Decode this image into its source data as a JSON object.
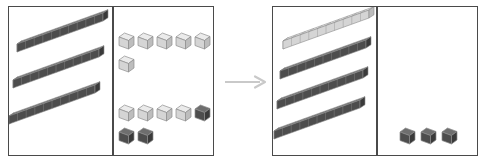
{
  "diagram": {
    "title": "Base-ten regrouping: ten ones exchanged for one ten",
    "type": "base-ten-blocks-regrouping",
    "arrow": {
      "label": "becomes",
      "direction": "right",
      "color": "#c9c9c9"
    },
    "colors": {
      "dark_block": "#4d4d4d",
      "dark_block_top": "#6e6e6e",
      "dark_block_side": "#3a3a3a",
      "light_block": "#d5d5d5",
      "light_block_top": "#ebebeb",
      "light_block_side": "#bdbdbd",
      "panel_border": "#4a4a4a",
      "background": "#ffffff",
      "outline": "#8c8c8c"
    },
    "panels": [
      {
        "name": "before-panel",
        "label": "Before regrouping",
        "columns": [
          {
            "name": "tens-column",
            "label": "Tens",
            "count": 3,
            "unit_label": "rod of ten",
            "rods": [
              {
                "shade": "dark",
                "units": 10,
                "x": 6,
                "y": 11
              },
              {
                "shade": "dark",
                "units": 10,
                "x": 2,
                "y": 47
              },
              {
                "shade": "dark",
                "units": 10,
                "x": -2,
                "y": 83
              }
            ]
          },
          {
            "name": "ones-column",
            "label": "Ones",
            "count": 13,
            "unit_label": "unit cube",
            "cubes": [
              {
                "shade": "light",
                "x": 5,
                "y": 25
              },
              {
                "shade": "light",
                "x": 24,
                "y": 25
              },
              {
                "shade": "light",
                "x": 43,
                "y": 25
              },
              {
                "shade": "light",
                "x": 62,
                "y": 25
              },
              {
                "shade": "light",
                "x": 81,
                "y": 25
              },
              {
                "shade": "light",
                "x": 5,
                "y": 48
              },
              {
                "shade": "light",
                "x": 5,
                "y": 97
              },
              {
                "shade": "light",
                "x": 24,
                "y": 97
              },
              {
                "shade": "light",
                "x": 43,
                "y": 97
              },
              {
                "shade": "light",
                "x": 62,
                "y": 97
              },
              {
                "shade": "dark",
                "x": 81,
                "y": 97
              },
              {
                "shade": "dark",
                "x": 5,
                "y": 120
              },
              {
                "shade": "dark",
                "x": 24,
                "y": 120
              }
            ]
          }
        ]
      },
      {
        "name": "after-panel",
        "label": "After regrouping",
        "columns": [
          {
            "name": "tens-column",
            "label": "Tens",
            "count": 4,
            "unit_label": "rod of ten",
            "rods": [
              {
                "shade": "light",
                "units": 10,
                "x": 8,
                "y": 8
              },
              {
                "shade": "dark",
                "units": 10,
                "x": 5,
                "y": 38
              },
              {
                "shade": "dark",
                "units": 10,
                "x": 2,
                "y": 68
              },
              {
                "shade": "dark",
                "units": 10,
                "x": -1,
                "y": 98
              }
            ]
          },
          {
            "name": "ones-column",
            "label": "Ones",
            "count": 3,
            "unit_label": "unit cube",
            "cubes": [
              {
                "shade": "dark",
                "x": 22,
                "y": 120
              },
              {
                "shade": "dark",
                "x": 43,
                "y": 120
              },
              {
                "shade": "dark",
                "x": 64,
                "y": 120
              }
            ]
          }
        ]
      }
    ]
  }
}
